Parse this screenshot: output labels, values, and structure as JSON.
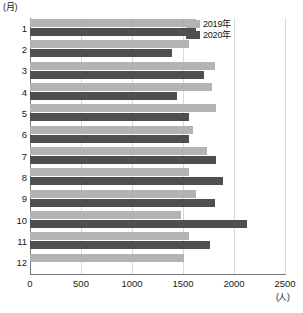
{
  "chart_data": {
    "type": "bar",
    "orientation": "horizontal",
    "title": "",
    "xlabel": "(人)",
    "ylabel": "(月)",
    "categories": [
      "1",
      "2",
      "3",
      "4",
      "5",
      "6",
      "7",
      "8",
      "9",
      "10",
      "11",
      "12"
    ],
    "xlim": [
      0,
      2500
    ],
    "xticks": [
      0,
      500,
      1000,
      1500,
      2000,
      2500
    ],
    "xtick_labels": [
      "0",
      "500",
      "1000",
      "1500",
      "2000",
      "2500"
    ],
    "grid": true,
    "grid_axis": "x",
    "legend_position": "top-right",
    "series": [
      {
        "name": "2019年",
        "color": "#b3b3b3",
        "values": [
          1630,
          1560,
          1810,
          1780,
          1820,
          1600,
          1740,
          1560,
          1630,
          1480,
          1560,
          1510
        ]
      },
      {
        "name": "2020年",
        "color": "#4f4f4f",
        "values": [
          1630,
          1390,
          1710,
          1440,
          1560,
          1560,
          1820,
          1890,
          1810,
          2130,
          1760,
          null
        ]
      }
    ]
  },
  "colors": {
    "series_2019": "#b3b3b3",
    "series_2020": "#4f4f4f",
    "gridline": "#d9d9d9",
    "axis": "#7a7a7a",
    "background": "#ffffff",
    "text": "#1a1a1a"
  }
}
